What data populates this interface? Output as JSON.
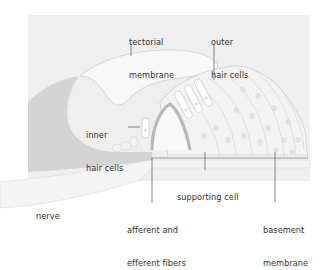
{
  "diagram": {
    "colors": {
      "background_panel": "#efefef",
      "page": "#ffffff",
      "dark_tissue": "#d2d2d2",
      "cell_fill": "#f7f7f7",
      "cell_outline": "#c9c9c9",
      "hair_cell": "#ffffff",
      "arch": "#b9b9b9",
      "leader_line": "#555555",
      "text": "#333333"
    },
    "labels": {
      "tectorial_membrane": {
        "line1": "tectorial",
        "line2": "membrane"
      },
      "outer_hair_cells": {
        "line1": "outer",
        "line2": "hair cells"
      },
      "inner_hair_cells": {
        "line1": "inner",
        "line2": "hair cells"
      },
      "supporting_cell": {
        "line1": "supporting cell"
      },
      "nerve": {
        "line1": "nerve"
      },
      "afferent_efferent_fibers": {
        "line1": "afferent and",
        "line2": "efferent fibers"
      },
      "basement_membrane": {
        "line1": "basement",
        "line2": "membrane"
      }
    }
  }
}
